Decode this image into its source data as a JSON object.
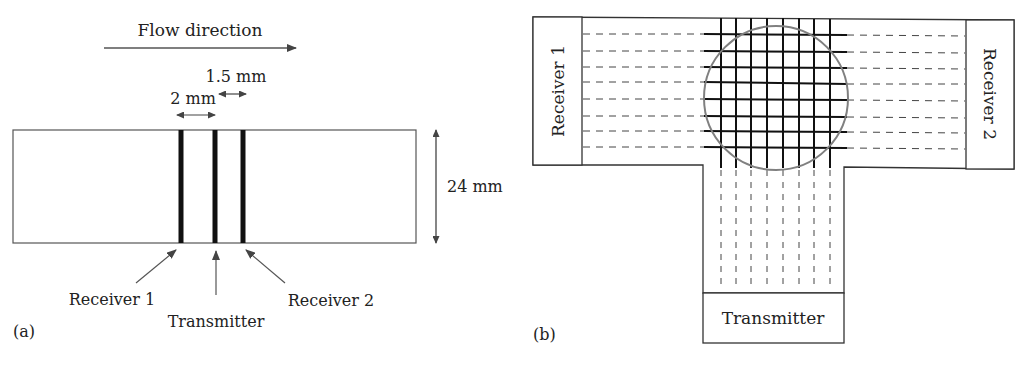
{
  "panel_a": {
    "flow_label": "Flow direction",
    "dim_spacing_1": "2 mm",
    "dim_spacing_2": "1.5 mm",
    "dim_height": "24 mm",
    "receiver1": "Receiver 1",
    "transmitter": "Transmitter",
    "receiver2": "Receiver 2",
    "tag": "(a)"
  },
  "panel_b": {
    "receiver1": "Receiver 1",
    "receiver2": "Receiver 2",
    "transmitter": "Transmitter",
    "tag": "(b)",
    "grid_lines": 8
  },
  "colors": {
    "line": "#222222",
    "circle": "#777777",
    "dashed": "#444444"
  }
}
